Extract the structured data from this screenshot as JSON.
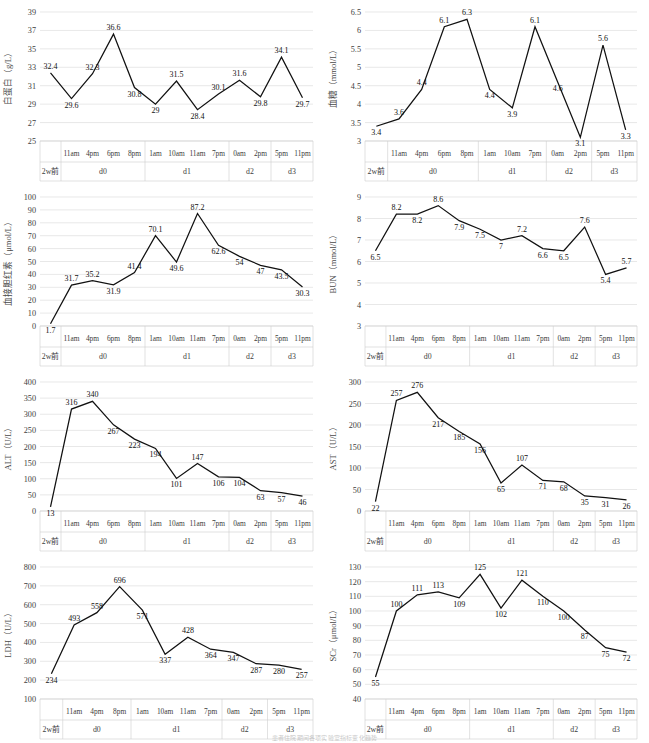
{
  "figure": {
    "caption": "患者住院期间各项实验室指标变化趋势",
    "panel_count": 8
  },
  "groups_13": [
    {
      "label": "2w前",
      "times": [
        " "
      ]
    },
    {
      "label": "d0",
      "times": [
        "11am",
        "4pm",
        "6pm",
        "8pm"
      ]
    },
    {
      "label": "d1",
      "times": [
        "1am",
        "10am",
        "11am",
        "7pm"
      ]
    },
    {
      "label": "d2",
      "times": [
        "0am",
        "2pm"
      ]
    },
    {
      "label": "d3",
      "times": [
        "5pm",
        "11pm"
      ]
    }
  ],
  "groups_11": [
    {
      "label": "2w前",
      "times": [
        " "
      ]
    },
    {
      "label": "d0",
      "times": [
        "11am",
        "4pm",
        "6pm",
        "8pm"
      ]
    },
    {
      "label": "d1",
      "times": [
        "1am",
        "10am",
        "7pm"
      ]
    },
    {
      "label": "d2",
      "times": [
        "0am",
        "2pm"
      ]
    },
    {
      "label": "d3",
      "times": [
        "5pm",
        "11pm"
      ]
    }
  ],
  "groups_12": [
    {
      "label": "2w前",
      "times": [
        " "
      ]
    },
    {
      "label": "d0",
      "times": [
        "11am",
        "4pm",
        "8pm"
      ]
    },
    {
      "label": "d1",
      "times": [
        "1am",
        "10am",
        "11am",
        "7pm"
      ]
    },
    {
      "label": "d2",
      "times": [
        "0am",
        "2pm"
      ]
    },
    {
      "label": "d3",
      "times": [
        "5pm",
        "11pm"
      ]
    }
  ],
  "chart_data": [
    {
      "id": "albumin",
      "type": "line",
      "title": "",
      "ylabel": "白蛋白（g/L）",
      "xlabel": "",
      "ylim": [
        25,
        39
      ],
      "ystep": 2,
      "yticks": [
        25,
        27,
        29,
        31,
        33,
        35,
        37,
        39
      ],
      "grid": true,
      "legend": "none",
      "categories": [
        "2w前",
        "11am",
        "4pm",
        "6pm",
        "8pm",
        "1am",
        "10am",
        "11am",
        "7pm",
        "0am",
        "2pm",
        "5pm",
        "11pm"
      ],
      "values": [
        32.4,
        29.6,
        32.3,
        36.6,
        30.8,
        29,
        31.5,
        28.4,
        30.1,
        31.6,
        29.8,
        34.1,
        29.7
      ],
      "groups_ref": "groups_13"
    },
    {
      "id": "blood-glucose",
      "type": "line",
      "title": "",
      "ylabel": "血糖（mmol/L）",
      "xlabel": "",
      "ylim": [
        3,
        6.5
      ],
      "ystep": 0.5,
      "yticks": [
        3,
        3.5,
        4,
        4.5,
        5,
        5.5,
        6,
        6.5
      ],
      "grid": true,
      "legend": "none",
      "categories": [
        "2w前",
        "11am",
        "4pm",
        "6pm",
        "8pm",
        "1am",
        "10am",
        "7pm",
        "0am",
        "2pm",
        "5pm",
        "11pm"
      ],
      "values": [
        3.4,
        3.6,
        4.4,
        6.1,
        6.3,
        4.4,
        3.9,
        6.1,
        4.6,
        3.1,
        5.6,
        3.3
      ],
      "groups_ref": "groups_11"
    },
    {
      "id": "direct-bilirubin",
      "type": "line",
      "title": "",
      "ylabel": "血接胆红素（μmol/L）",
      "xlabel": "",
      "ylim": [
        0,
        100
      ],
      "ystep": 10,
      "yticks": [
        0,
        10,
        20,
        30,
        40,
        50,
        60,
        70,
        80,
        90,
        100
      ],
      "grid": true,
      "legend": "none",
      "categories": [
        "2w前",
        "11am",
        "4pm",
        "6pm",
        "8pm",
        "1am",
        "10am",
        "11am",
        "7pm",
        "0am",
        "2pm",
        "5pm",
        "11pm"
      ],
      "values": [
        1.7,
        31.7,
        35.2,
        31.9,
        41.4,
        70.1,
        49.6,
        87.2,
        62.6,
        54,
        47,
        43.5,
        30.3
      ],
      "groups_ref": "groups_13"
    },
    {
      "id": "bun",
      "type": "line",
      "title": "",
      "ylabel": "BUN（mmol/L）",
      "xlabel": "",
      "ylim": [
        3,
        9
      ],
      "ystep": 1,
      "yticks": [
        3,
        4,
        5,
        6,
        7,
        8,
        9
      ],
      "grid": true,
      "legend": "none",
      "categories": [
        "2w前",
        "11am",
        "4pm",
        "6pm",
        "8pm",
        "1am",
        "10am",
        "11am",
        "7pm",
        "0am",
        "2pm",
        "5pm",
        "11pm"
      ],
      "values": [
        6.5,
        8.2,
        8.2,
        8.6,
        7.9,
        7.5,
        7,
        7.2,
        6.6,
        6.5,
        7.6,
        5.4,
        5.7
      ],
      "groups_ref": "groups_13"
    },
    {
      "id": "alt",
      "type": "line",
      "title": "",
      "ylabel": "ALT（U/L）",
      "xlabel": "",
      "ylim": [
        0,
        400
      ],
      "ystep": 50,
      "yticks": [
        0,
        50,
        100,
        150,
        200,
        250,
        300,
        350,
        400
      ],
      "grid": true,
      "legend": "none",
      "categories": [
        "2w前",
        "11am",
        "4pm",
        "6pm",
        "8pm",
        "1am",
        "10am",
        "11am",
        "7pm",
        "0am",
        "2pm",
        "5pm",
        "11pm"
      ],
      "values": [
        13,
        316,
        340,
        267,
        223,
        194,
        101,
        147,
        106,
        104,
        63,
        57,
        46
      ],
      "groups_ref": "groups_13"
    },
    {
      "id": "ast",
      "type": "line",
      "title": "",
      "ylabel": "AST（U/L）",
      "xlabel": "",
      "ylim": [
        0,
        300
      ],
      "ystep": 50,
      "yticks": [
        0,
        50,
        100,
        150,
        200,
        250,
        300
      ],
      "grid": true,
      "legend": "none",
      "categories": [
        "2w前",
        "11am",
        "4pm",
        "6pm",
        "8pm",
        "1am",
        "10am",
        "11am",
        "7pm",
        "0am",
        "2pm",
        "5pm",
        "11pm"
      ],
      "values": [
        22,
        257,
        276,
        217,
        185,
        156,
        65,
        107,
        71,
        68,
        35,
        31,
        26
      ],
      "groups_ref": "groups_13"
    },
    {
      "id": "ldh",
      "type": "line",
      "title": "",
      "ylabel": "LDH（U/L）",
      "xlabel": "",
      "ylim": [
        100,
        800
      ],
      "ystep": 100,
      "yticks": [
        100,
        200,
        300,
        400,
        500,
        600,
        700,
        800
      ],
      "grid": true,
      "legend": "none",
      "categories": [
        "2w前",
        "11am",
        "4pm",
        "8pm",
        "1am",
        "10am",
        "11am",
        "7pm",
        "0am",
        "2pm",
        "5pm",
        "11pm"
      ],
      "values": [
        234,
        493,
        558,
        696,
        571,
        337,
        428,
        364,
        347,
        287,
        280,
        257
      ],
      "groups_ref": "groups_12"
    },
    {
      "id": "scr",
      "type": "line",
      "title": "",
      "ylabel": "SCr（μmol/L）",
      "xlabel": "",
      "ylim": [
        40,
        130
      ],
      "ystep": 10,
      "yticks": [
        40,
        50,
        60,
        70,
        80,
        90,
        100,
        110,
        120,
        130
      ],
      "grid": true,
      "legend": "none",
      "categories": [
        "2w前",
        "11am",
        "4pm",
        "6pm",
        "8pm",
        "1am",
        "10am",
        "11am",
        "7pm",
        "0am",
        "2pm",
        "5pm",
        "11pm"
      ],
      "values": [
        55,
        100,
        111,
        113,
        109,
        125,
        102,
        121,
        110,
        100,
        87,
        75,
        72
      ],
      "groups_ref": "groups_13"
    }
  ]
}
